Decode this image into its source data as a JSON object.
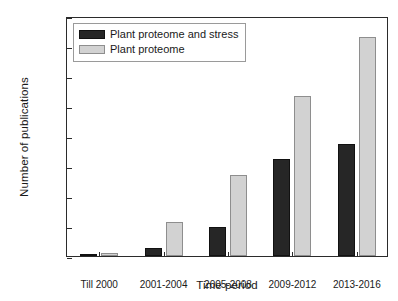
{
  "chart_data": {
    "type": "bar",
    "title": "",
    "xlabel": "Time period",
    "ylabel": "Number of publications",
    "categories": [
      "Till 2000",
      "2001-2004",
      "2005-2008",
      "2009-2012",
      "2013-2016"
    ],
    "series": [
      {
        "name": "Plant proteome and stress",
        "color": "#262626",
        "values": [
          3,
          55,
          195,
          650,
          750
        ]
      },
      {
        "name": "Plant proteome",
        "color": "#d2d2d2",
        "values": [
          20,
          230,
          540,
          1065,
          1460
        ]
      }
    ],
    "ylim": [
      0,
      1600
    ],
    "yticks": [
      0,
      200,
      400,
      600,
      800,
      1000,
      1200,
      1400,
      1600
    ],
    "ytick_labels": [
      "0",
      "200",
      "400",
      "600",
      "800",
      "1000",
      "1200",
      "1400",
      "1600"
    ],
    "grid": false,
    "legend_position": "upper left"
  },
  "legend": {
    "items": [
      {
        "label": "Plant proteome and stress",
        "swatch": "dark"
      },
      {
        "label": "Plant proteome",
        "swatch": "light"
      }
    ]
  }
}
